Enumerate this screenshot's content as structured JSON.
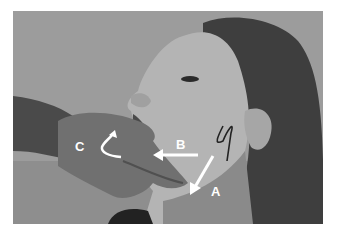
{
  "figure": {
    "labels": {
      "a": "A",
      "b": "B",
      "c": "C"
    },
    "colors": {
      "background": "#9a9a9a",
      "annotation": "#ffffff",
      "skin": "#b0b0b0",
      "hair": "#3a3a3a",
      "glove": "#6e6e6e"
    }
  }
}
